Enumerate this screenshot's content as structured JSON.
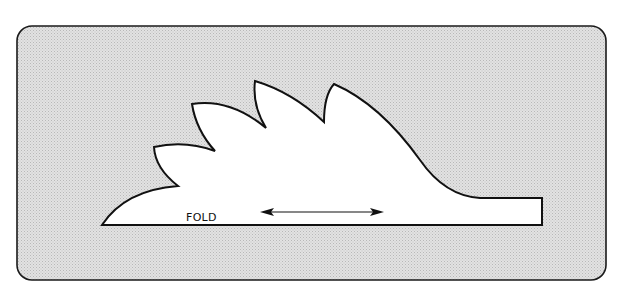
{
  "diagram": {
    "type": "sewing-pattern-piece",
    "panel": {
      "fill": "#d6d6d6",
      "stroke": "#1a1a1a"
    },
    "piece": {
      "fill": "#ffffff",
      "stroke": "#111111",
      "lobes": 5
    },
    "labels": {
      "fold": "FOLD"
    },
    "grainline": {
      "type": "double-headed-arrow",
      "orientation": "horizontal"
    }
  }
}
